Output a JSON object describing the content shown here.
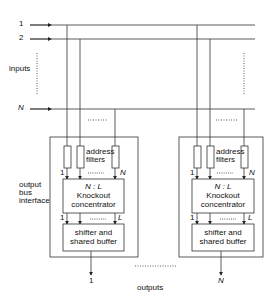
{
  "diagram": {
    "type": "knockout switch architecture",
    "inputs": {
      "label": "inputs",
      "lines": [
        "1",
        "2",
        "N"
      ]
    },
    "modules": [
      {
        "id": "left",
        "address_filters_label": "address filters",
        "filter_first": "1",
        "filter_last": "N",
        "concentrator_ratio": "N : L",
        "concentrator_label": "Knockout concentrator",
        "conc_first": "1",
        "conc_last": "L",
        "buffer_label": "shifter and shared buffer",
        "output": "1"
      },
      {
        "id": "right",
        "address_filters_label": "address filters",
        "filter_first": "1",
        "filter_last": "N",
        "concentrator_ratio": "N : L",
        "concentrator_label": "Knockout concentrator",
        "conc_first": "1",
        "conc_last": "L",
        "buffer_label": "shifter and shared buffer",
        "output": "N"
      }
    ],
    "interface_label": "output bus interface",
    "outputs_label": "outputs",
    "line_color": "#333333"
  },
  "text": {
    "in1": "1",
    "in2": "2",
    "inN": "N",
    "inputs": "inputs",
    "obi1": "output",
    "obi2": "bus",
    "obi3": "interface",
    "af1": "address",
    "af2": "filters",
    "f1": "1",
    "fN": "N",
    "ratio": "N : L",
    "ko1": "Knockout",
    "ko2": "concentrator",
    "c1": "1",
    "cL": "L",
    "sb1": "shifter and",
    "sb2": "shared buffer",
    "out1": "1",
    "outN": "N",
    "outputs": "outputs"
  }
}
